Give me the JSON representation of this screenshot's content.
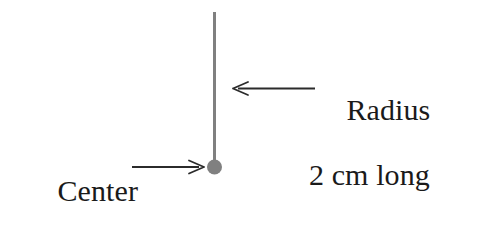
{
  "figure": {
    "background_color": "#ffffff",
    "line_color": "#808080",
    "arrow_color": "#2b2b2b",
    "text_color": "#1a1a1a",
    "annotations": {
      "radius": {
        "line1": "Radius",
        "line2": "2 cm long",
        "arrow": "left-arrow",
        "arrow_direction": "left"
      },
      "center": {
        "line1": "Center",
        "line2": "point",
        "arrow": "right-arrow",
        "arrow_direction": "right"
      }
    },
    "shapes": {
      "radius_segment": {
        "name": "vertical-radius-line",
        "x": 214,
        "y_top": 12,
        "y_bottom": 167,
        "stroke_width": 3
      },
      "center_dot": {
        "name": "center-point-dot",
        "cx": 214,
        "cy": 167,
        "r": 7.5
      }
    }
  }
}
